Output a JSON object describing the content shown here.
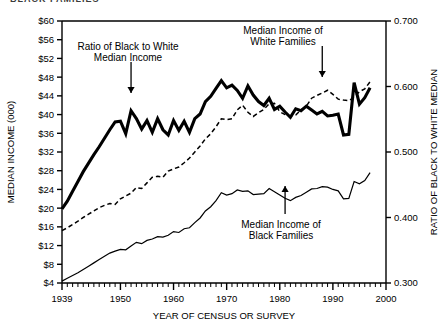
{
  "figure": {
    "top_clipped_text": "BLACK FAMILIES",
    "axis_color": "#000000",
    "background": "#ffffff"
  },
  "chart_data": {
    "type": "line",
    "title": "",
    "xlabel": "YEAR OF CENSUS OR SURVEY",
    "ylabel_left": "MEDIAN INCOME (000)",
    "ylabel_right": "RATIO OF BLACK TO WHITE MEDIAN",
    "xlim": [
      1939,
      2000
    ],
    "xticks": [
      1939,
      1950,
      1960,
      1970,
      1980,
      1990,
      2000
    ],
    "xticklabels": [
      "1939",
      "1950",
      "1960",
      "1970",
      "1980",
      "1990",
      "2000"
    ],
    "xminor_tick_interval": 1,
    "ylim_left": [
      4,
      60
    ],
    "yticks_left": [
      4,
      8,
      12,
      16,
      20,
      24,
      28,
      32,
      36,
      40,
      44,
      48,
      52,
      56,
      60
    ],
    "yticklabels_left": [
      "$4",
      "$8",
      "$12",
      "$16",
      "$20",
      "$24",
      "$28",
      "$32",
      "$36",
      "$40",
      "$44",
      "$48",
      "$52",
      "$56",
      "$60"
    ],
    "ylim_right": [
      0.3,
      0.7
    ],
    "yticks_right": [
      0.3,
      0.4,
      0.5,
      0.6,
      0.7
    ],
    "yticklabels_right": [
      "0.300",
      "0.400",
      "0.500",
      "0.600",
      "0.700"
    ],
    "grid": false,
    "legend_position": "annotations-inline",
    "annotations": [
      {
        "name": "ratio-annotation",
        "text_lines": [
          "Ratio of Black to White",
          "Median Income"
        ],
        "arrow": "down",
        "points_to_year": 1952
      },
      {
        "name": "white-families-annotation",
        "text_lines": [
          "Median Income of",
          "White Families"
        ],
        "arrow": "down",
        "points_to_year": 1988
      },
      {
        "name": "black-families-annotation",
        "text_lines": [
          "Median Income of",
          "Black Families"
        ],
        "arrow": "up",
        "points_to_year": 1981
      }
    ],
    "series": [
      {
        "name": "Ratio of Black to White Median Income",
        "axis": "right",
        "style": "solid-thick",
        "color": "#000000",
        "x": [
          1939,
          1940,
          1941,
          1942,
          1943,
          1944,
          1945,
          1946,
          1947,
          1948,
          1949,
          1950,
          1951,
          1952,
          1953,
          1954,
          1955,
          1956,
          1957,
          1958,
          1959,
          1960,
          1961,
          1962,
          1963,
          1964,
          1965,
          1966,
          1967,
          1968,
          1969,
          1970,
          1971,
          1972,
          1973,
          1974,
          1975,
          1976,
          1977,
          1978,
          1979,
          1980,
          1981,
          1982,
          1983,
          1984,
          1985,
          1986,
          1987,
          1988,
          1989,
          1990,
          1991,
          1992,
          1993,
          1994,
          1995,
          1996,
          1997
        ],
        "values": [
          0.413,
          0.425,
          0.44,
          0.455,
          0.47,
          0.483,
          0.496,
          0.508,
          0.521,
          0.534,
          0.546,
          0.547,
          0.528,
          0.563,
          0.551,
          0.535,
          0.548,
          0.53,
          0.551,
          0.534,
          0.526,
          0.548,
          0.533,
          0.547,
          0.53,
          0.551,
          0.558,
          0.577,
          0.585,
          0.597,
          0.609,
          0.598,
          0.602,
          0.594,
          0.582,
          0.601,
          0.587,
          0.577,
          0.571,
          0.582,
          0.565,
          0.57,
          0.561,
          0.553,
          0.566,
          0.563,
          0.57,
          0.564,
          0.558,
          0.562,
          0.555,
          0.556,
          0.558,
          0.526,
          0.527,
          0.606,
          0.573,
          0.583,
          0.598
        ]
      },
      {
        "name": "Median Income of White Families",
        "axis": "left",
        "style": "dashed",
        "color": "#000000",
        "x": [
          1939,
          1940,
          1941,
          1942,
          1943,
          1944,
          1945,
          1946,
          1947,
          1948,
          1949,
          1950,
          1951,
          1952,
          1953,
          1954,
          1955,
          1956,
          1957,
          1958,
          1959,
          1960,
          1961,
          1962,
          1963,
          1964,
          1965,
          1966,
          1967,
          1968,
          1969,
          1970,
          1971,
          1972,
          1973,
          1974,
          1975,
          1976,
          1977,
          1978,
          1979,
          1980,
          1981,
          1982,
          1983,
          1984,
          1985,
          1986,
          1987,
          1988,
          1989,
          1990,
          1991,
          1992,
          1993,
          1994,
          1995,
          1996,
          1997
        ],
        "values": [
          15.2,
          15.8,
          16.5,
          17.2,
          18.0,
          18.7,
          19.4,
          20.1,
          20.6,
          21.0,
          20.8,
          22.0,
          22.6,
          23.2,
          24.4,
          24.2,
          25.4,
          26.6,
          26.8,
          26.6,
          27.9,
          28.4,
          28.8,
          29.7,
          30.7,
          32.0,
          33.3,
          34.8,
          35.9,
          37.4,
          39.1,
          38.9,
          39.1,
          41.0,
          42.0,
          40.5,
          39.6,
          40.4,
          41.1,
          42.3,
          42.4,
          40.6,
          40.0,
          39.7,
          39.9,
          41.0,
          41.8,
          43.5,
          44.1,
          44.6,
          45.2,
          44.3,
          43.3,
          43.1,
          43.0,
          43.7,
          44.9,
          45.5,
          47.0
        ]
      },
      {
        "name": "Median Income of Black Families",
        "axis": "left",
        "style": "solid-thin",
        "color": "#000000",
        "x": [
          1939,
          1940,
          1941,
          1942,
          1943,
          1944,
          1945,
          1946,
          1947,
          1948,
          1949,
          1950,
          1951,
          1952,
          1953,
          1954,
          1955,
          1956,
          1957,
          1958,
          1959,
          1960,
          1961,
          1962,
          1963,
          1964,
          1965,
          1966,
          1967,
          1968,
          1969,
          1970,
          1971,
          1972,
          1973,
          1974,
          1975,
          1976,
          1977,
          1978,
          1979,
          1980,
          1981,
          1982,
          1983,
          1984,
          1985,
          1986,
          1987,
          1988,
          1989,
          1990,
          1991,
          1992,
          1993,
          1994,
          1995,
          1996,
          1997
        ],
        "values": [
          4.4,
          5.0,
          5.6,
          6.2,
          6.9,
          7.6,
          8.3,
          9.0,
          9.7,
          10.4,
          10.8,
          11.2,
          11.1,
          11.9,
          12.7,
          12.4,
          13.1,
          13.4,
          13.9,
          13.8,
          14.2,
          15.0,
          14.8,
          15.6,
          15.8,
          16.9,
          17.9,
          19.4,
          20.3,
          21.6,
          23.3,
          22.8,
          23.1,
          23.9,
          23.6,
          23.7,
          22.9,
          23.0,
          23.1,
          24.2,
          23.5,
          22.8,
          22.1,
          21.6,
          22.3,
          22.7,
          23.4,
          24.1,
          24.2,
          24.6,
          24.5,
          24.0,
          23.7,
          22.0,
          22.1,
          25.7,
          25.2,
          25.9,
          27.6
        ]
      }
    ]
  }
}
